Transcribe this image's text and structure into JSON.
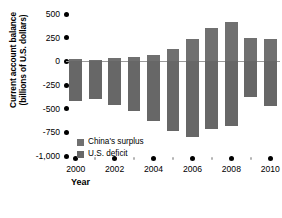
{
  "chart_data": {
    "type": "bar",
    "title": "",
    "xlabel": "Year",
    "ylabel": "Current account balance (billions of U.S. dollars)",
    "ylabel_lines": [
      "Current account balance",
      "(billions of U.S. dollars)"
    ],
    "categories": [
      2000,
      2001,
      2002,
      2003,
      2004,
      2005,
      2006,
      2007,
      2008,
      2009,
      2010
    ],
    "series": [
      {
        "name": "China's surplus",
        "color": "#707070",
        "values": [
          20,
          17,
          35,
          46,
          69,
          132,
          232,
          354,
          412,
          243,
          238
        ]
      },
      {
        "name": "U.S. deficit",
        "color": "#676767",
        "values": [
          -415,
          -395,
          -460,
          -520,
          -630,
          -740,
          -800,
          -710,
          -680,
          -380,
          -470
        ]
      }
    ],
    "ylim": [
      -1000,
      500
    ],
    "ytick_values": [
      500,
      250,
      0,
      -250,
      -500,
      -750,
      -1000
    ],
    "ytick_labels": [
      "500",
      "250",
      "0",
      "-250",
      "-500",
      "-750",
      "-1,000"
    ],
    "xtick_values": [
      2000,
      2002,
      2004,
      2006,
      2008,
      2010
    ],
    "xtick_labels": [
      "2000",
      "2002",
      "2004",
      "2006",
      "2008",
      "2010"
    ],
    "xminor_values": [
      2001,
      2003,
      2005,
      2007,
      2009
    ],
    "grid": false,
    "legend_position": "bottom-left",
    "zero_line_color": "#9a9a9a"
  }
}
